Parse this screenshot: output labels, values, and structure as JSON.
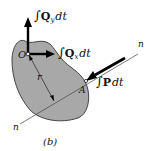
{
  "figure": {
    "caption": "(b)",
    "colors": {
      "body_fill": "#a8a8a8",
      "body_stroke": "#333333",
      "line": "#444444",
      "arrow": "#000000",
      "text": "#111111"
    },
    "labels": {
      "qy_integral": "∫",
      "qy_symbol": "Q",
      "qy_sub": "y",
      "qy_dt": "dt",
      "qx_integral": "∫",
      "qx_symbol": "Q",
      "qx_sub": "x",
      "qx_dt": "dt",
      "p_integral": "∫",
      "p_symbol": "P",
      "p_dt": "dt",
      "point_o": "O",
      "point_a": "A",
      "radius": "r",
      "line_n_top": "n",
      "line_n_bottom": "n"
    }
  }
}
